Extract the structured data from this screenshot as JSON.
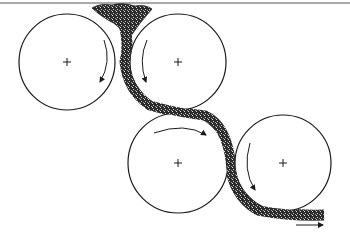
{
  "diagram": {
    "type": "calender-roll-diagram",
    "colors": {
      "line": "#1a1a1a",
      "sheet": "#2a2a2a",
      "background": "#ffffff"
    },
    "rolls": [
      {
        "name": "roll-1",
        "cx": 67,
        "cy": 62,
        "r": 48,
        "rotation": "clockwise"
      },
      {
        "name": "roll-2",
        "cx": 178,
        "cy": 62,
        "r": 48,
        "rotation": "counterclockwise"
      },
      {
        "name": "roll-3",
        "cx": 178,
        "cy": 163,
        "r": 50,
        "rotation": "clockwise"
      },
      {
        "name": "roll-4",
        "cx": 283,
        "cy": 163,
        "r": 48,
        "rotation": "counterclockwise"
      }
    ],
    "output_direction": "right"
  }
}
